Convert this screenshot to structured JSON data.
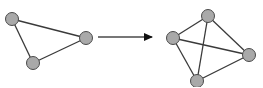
{
  "diagram": {
    "colors": {
      "node_fill": "#a9a9a9",
      "node_stroke": "#4a4a4a",
      "edge": "#3a3a3a",
      "arrow": "#4a4a4a",
      "arrowhead": "#111111",
      "background": "#ffffff"
    },
    "node_radius": 6.5,
    "left_graph": {
      "name": "triangle",
      "nodes": [
        {
          "id": "A",
          "x": 12,
          "y": 19
        },
        {
          "id": "B",
          "x": 86,
          "y": 38
        },
        {
          "id": "C",
          "x": 33,
          "y": 63
        }
      ],
      "edges": [
        [
          "A",
          "B"
        ],
        [
          "A",
          "C"
        ],
        [
          "B",
          "C"
        ]
      ]
    },
    "arrow": {
      "x1": 98,
      "y1": 37,
      "x2": 158,
      "y2": 37
    },
    "right_graph": {
      "name": "complete-graph-k4",
      "nodes": [
        {
          "id": "T",
          "x": 208,
          "y": 16
        },
        {
          "id": "L",
          "x": 173,
          "y": 38
        },
        {
          "id": "R",
          "x": 249,
          "y": 55
        },
        {
          "id": "D",
          "x": 197,
          "y": 81
        }
      ],
      "edges": [
        [
          "T",
          "L"
        ],
        [
          "T",
          "R"
        ],
        [
          "T",
          "D"
        ],
        [
          "L",
          "R"
        ],
        [
          "L",
          "D"
        ],
        [
          "R",
          "D"
        ]
      ]
    }
  }
}
